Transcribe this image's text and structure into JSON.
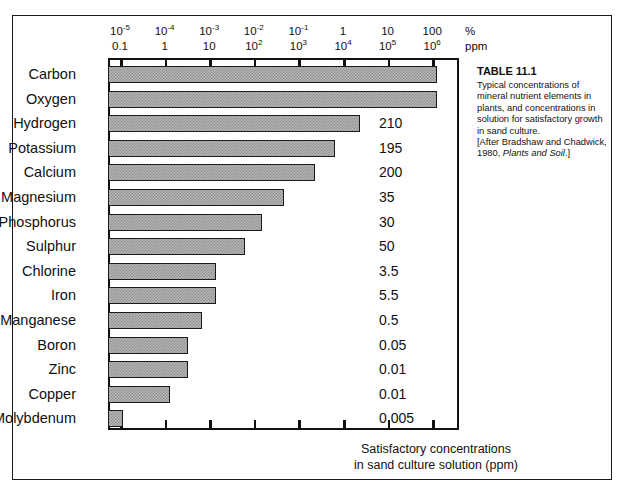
{
  "figure": {
    "caption_title": "TABLE 11.1",
    "caption_body": "Typical concentrations of mineral nutrient elements in plants, and concentrations in solution for satisfactory growth in sand culture.",
    "caption_source_pre": "[After Bradshaw and Chadwick, 1980, ",
    "caption_source_italic": "Plants and Soil",
    "caption_source_post": ".]",
    "axis_caption_line1": "Satisfactory  concentrations",
    "axis_caption_line2": "in sand culture  solution (ppm)"
  },
  "chart_data": {
    "type": "bar",
    "orientation": "horizontal",
    "title": "TABLE 11.1",
    "xlabel": "Satisfactory concentrations in sand culture solution (ppm)",
    "ylabel": "",
    "scale": "log",
    "grid": false,
    "legend": null,
    "top_axis_label": "%",
    "bottom_axis_label": "ppm",
    "top_axis_ticks": [
      "10-5",
      "10-4",
      "10-3",
      "10-2",
      "10-1",
      "1",
      "10",
      "100"
    ],
    "top_axis_ticks_display": [
      {
        "mantissa": "10",
        "exponent": "-5"
      },
      {
        "mantissa": "10",
        "exponent": "-4"
      },
      {
        "mantissa": "10",
        "exponent": "-3"
      },
      {
        "mantissa": "10",
        "exponent": "-2"
      },
      {
        "mantissa": "10",
        "exponent": "-1"
      },
      {
        "mantissa": "1",
        "exponent": ""
      },
      {
        "mantissa": "10",
        "exponent": ""
      },
      {
        "mantissa": "100",
        "exponent": ""
      }
    ],
    "ppm_axis_ticks_display": [
      {
        "mantissa": "0.1",
        "exponent": ""
      },
      {
        "mantissa": "1",
        "exponent": ""
      },
      {
        "mantissa": "10",
        "exponent": ""
      },
      {
        "mantissa": "10",
        "exponent": "2"
      },
      {
        "mantissa": "10",
        "exponent": "3"
      },
      {
        "mantissa": "10",
        "exponent": "4"
      },
      {
        "mantissa": "10",
        "exponent": "5"
      },
      {
        "mantissa": "10",
        "exponent": "6"
      }
    ],
    "xlim_ppm": [
      0.03,
      3000000
    ],
    "categories": [
      "Carbon",
      "Oxygen",
      "Hydrogen",
      "Potassium",
      "Calcium",
      "Magnesium",
      "Phosphorus",
      "Sulphur",
      "Chlorine",
      "Iron",
      "Manganese",
      "Boron",
      "Zinc",
      "Copper",
      "Molybdenum"
    ],
    "values_percent_in_plant": [
      45,
      45,
      6,
      1.0,
      0.5,
      0.2,
      0.2,
      0.1,
      0.01,
      0.01,
      0.005,
      0.002,
      0.002,
      0.0006,
      1e-05
    ],
    "bar_lengths_px": [
      329,
      329,
      252,
      227,
      207,
      176,
      154,
      137,
      108,
      108,
      94,
      80,
      80,
      62,
      15
    ],
    "solution_concentrations_ppm": [
      null,
      null,
      "210",
      "195",
      "200",
      "35",
      "30",
      "50",
      "3.5",
      "5.5",
      "0.5",
      "0.05",
      "0.01",
      "0.01",
      "0.005"
    ],
    "rows": [
      {
        "element": "Carbon",
        "bar_px": 329,
        "value": ""
      },
      {
        "element": "Oxygen",
        "bar_px": 329,
        "value": ""
      },
      {
        "element": "Hydrogen",
        "bar_px": 252,
        "value": "210"
      },
      {
        "element": "Potassium",
        "bar_px": 227,
        "value": "195"
      },
      {
        "element": "Calcium",
        "bar_px": 207,
        "value": "200"
      },
      {
        "element": "Magnesium",
        "bar_px": 176,
        "value": "35"
      },
      {
        "element": "Phosphorus",
        "bar_px": 154,
        "value": "30"
      },
      {
        "element": "Sulphur",
        "bar_px": 137,
        "value": "50"
      },
      {
        "element": "Chlorine",
        "bar_px": 108,
        "value": "3.5"
      },
      {
        "element": "Iron",
        "bar_px": 108,
        "value": "5.5"
      },
      {
        "element": "Manganese",
        "bar_px": 94,
        "value": "0.5"
      },
      {
        "element": "Boron",
        "bar_px": 80,
        "value": "0.05"
      },
      {
        "element": "Zinc",
        "bar_px": 80,
        "value": "0.01"
      },
      {
        "element": "Copper",
        "bar_px": 62,
        "value": "0.01"
      },
      {
        "element": "Molybdenum",
        "bar_px": 15,
        "value": "0.005"
      }
    ]
  },
  "colors": {
    "bar_fill": "#b5b5b5",
    "bar_stroke": "#1a1a1a",
    "axis": "#111111",
    "background": "#ffffff"
  }
}
